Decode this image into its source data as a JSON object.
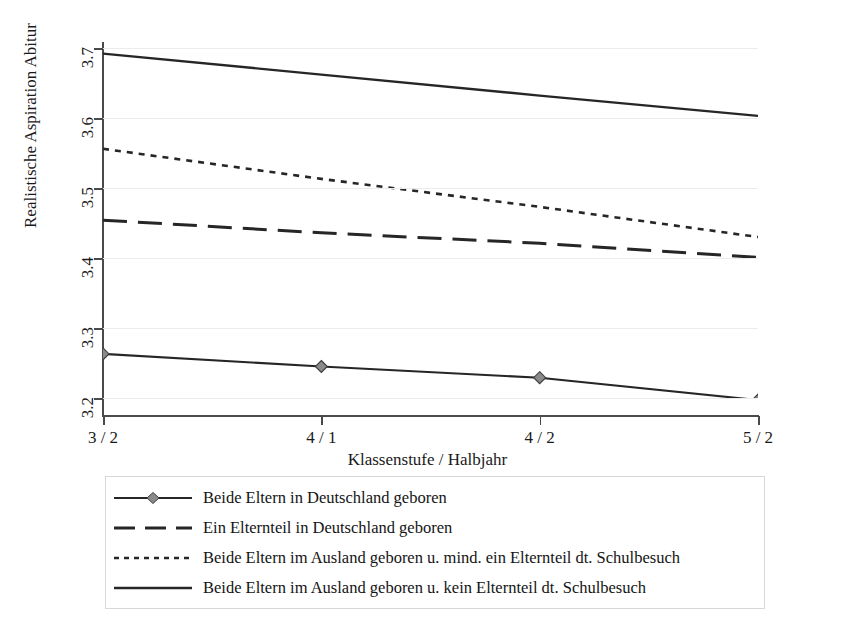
{
  "figure": {
    "top_crumb": "",
    "background": "#ffffff",
    "line_color": "#262626",
    "grid_color": "#ececec",
    "axis_color": "#4a4a4a",
    "marker_fill": "#8a8a8a"
  },
  "axes": {
    "ylabel": "Realistische Aspiration Abitur",
    "xlabel": "Klassenstufe / Halbjahr",
    "yticks": [
      "3.2",
      "3.3",
      "3.4",
      "3.5",
      "3.6",
      "3.7"
    ],
    "xticks": [
      "3 / 2",
      "4 / 1",
      "4 / 2",
      "5 / 2"
    ]
  },
  "legend": {
    "items": [
      {
        "style": "solid-marker",
        "label": "Beide Eltern in Deutschland geboren"
      },
      {
        "style": "long-dash",
        "label": "Ein Elternteil in Deutschland geboren"
      },
      {
        "style": "dotted",
        "label": "Beide Eltern im Ausland geboren u. mind. ein Elternteil dt. Schulbesuch"
      },
      {
        "style": "solid",
        "label": "Beide Eltern im Ausland geboren u. kein Elternteil dt. Schulbesuch"
      }
    ]
  },
  "chart_data": {
    "type": "line",
    "title": "",
    "xlabel": "Klassenstufe / Halbjahr",
    "ylabel": "Realistische Aspiration Abitur",
    "categories": [
      "3 / 2",
      "4 / 1",
      "4 / 2",
      "5 / 2"
    ],
    "x": [
      0,
      1,
      2,
      3
    ],
    "ylim": [
      3.15,
      3.72
    ],
    "yticks": [
      3.2,
      3.3,
      3.4,
      3.5,
      3.6,
      3.7
    ],
    "grid": "horizontal",
    "legend_position": "below-axes",
    "series": [
      {
        "name": "Beide Eltern in Deutschland geboren",
        "style": "solid",
        "marker": "diamond",
        "values": [
          3.263,
          3.245,
          3.229,
          3.197
        ]
      },
      {
        "name": "Ein Elternteil in Deutschland geboren",
        "style": "long-dash",
        "marker": "none",
        "values": [
          3.454,
          3.436,
          3.421,
          3.401
        ]
      },
      {
        "name": "Beide Eltern im Ausland geboren u. mind. ein Elternteil dt. Schulbesuch",
        "style": "dotted",
        "marker": "none",
        "values": [
          3.556,
          3.513,
          3.473,
          3.43
        ]
      },
      {
        "name": "Beide Eltern im Ausland geboren u. kein Elternteil dt. Schulbesuch",
        "style": "solid",
        "marker": "none",
        "values": [
          3.692,
          3.662,
          3.632,
          3.603
        ]
      }
    ]
  }
}
